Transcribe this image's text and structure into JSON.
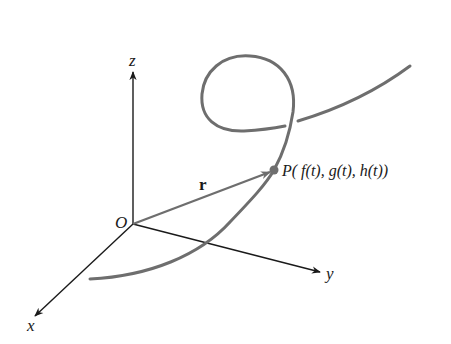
{
  "diagram": {
    "axes": {
      "origin_label": "O",
      "x_label": "x",
      "y_label": "y",
      "z_label": "z"
    },
    "vector_label": "r",
    "point_label": "P( f(t), g(t), h(t))",
    "colors": {
      "axes": "#1a1a1a",
      "curve": "#6e6e6e",
      "vector": "#6e6e6e",
      "point": "#6e6e6e",
      "background": "#ffffff"
    }
  }
}
